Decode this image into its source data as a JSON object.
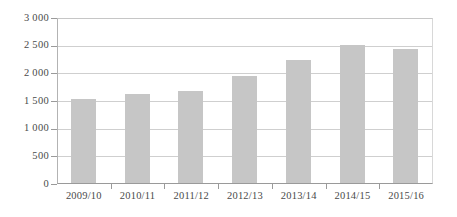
{
  "chart_data": {
    "type": "bar",
    "title": "",
    "subtitle": "",
    "xlabel": "",
    "ylabel": "",
    "categories": [
      "2009/10",
      "2010/11",
      "2011/12",
      "2012/13",
      "2013/14",
      "2014/15",
      "2015/16"
    ],
    "values": [
      1530,
      1620,
      1680,
      1950,
      2240,
      2520,
      2440
    ],
    "series": [
      {
        "name": "",
        "values": [
          1530,
          1620,
          1680,
          1950,
          2240,
          2520,
          2440
        ]
      }
    ],
    "ylim": [
      0,
      3000
    ],
    "yticks": [
      0,
      500,
      1000,
      1500,
      2000,
      2500,
      3000
    ],
    "ytick_labels": [
      "0",
      "500",
      "1 000",
      "1 500",
      "2 000",
      "2 500",
      "3 000"
    ],
    "xtick_labels": [
      "2009/10",
      "2010/11",
      "2011/12",
      "2012/13",
      "2013/14",
      "2014/15",
      "2015/16"
    ],
    "grid": true,
    "grid_axis": "y",
    "legend": false,
    "legend_position": "none",
    "annotations": [],
    "colors": {
      "bar_fill": "#c6c6c6",
      "gridline": "#cfcfcf",
      "axis": "#9a9a9a",
      "text": "#4a4a4a",
      "background": "#ffffff"
    }
  }
}
